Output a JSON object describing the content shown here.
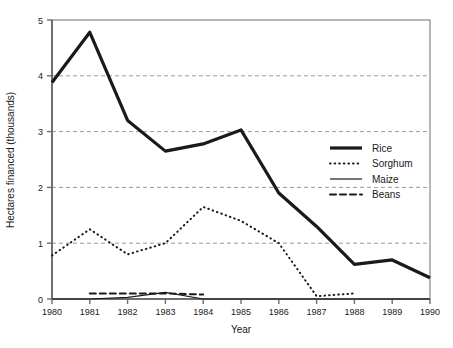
{
  "chart_data": {
    "type": "line",
    "title": "",
    "xlabel": "Year",
    "ylabel": "Hectares financed (thousands)",
    "xlim": [
      1980,
      1990
    ],
    "ylim": [
      0,
      5
    ],
    "xticks": [
      "1980",
      "1981",
      "1982",
      "1983",
      "1984",
      "1985",
      "1986",
      "1987",
      "1988",
      "1989",
      "1990"
    ],
    "yticks": [
      "0",
      "1",
      "2",
      "3",
      "4",
      "5"
    ],
    "grid": "horizontal dashed gridlines at y = 1, 2, 3, 4",
    "legend_position": "upper-right inside plot area",
    "x": [
      1980,
      1981,
      1982,
      1983,
      1984,
      1985,
      1986,
      1987,
      1988,
      1989,
      1990
    ],
    "series": [
      {
        "name": "Rice",
        "style": "solid-thick",
        "color": "#1a1a1a",
        "values": [
          3.88,
          4.78,
          3.2,
          2.65,
          2.78,
          3.03,
          1.9,
          1.3,
          0.62,
          0.7,
          0.38
        ]
      },
      {
        "name": "Sorghum",
        "style": "dotted",
        "color": "#1a1a1a",
        "values": [
          0.78,
          1.25,
          0.8,
          1.0,
          1.65,
          1.4,
          1.0,
          0.05,
          0.1,
          null,
          null
        ]
      },
      {
        "name": "Maize",
        "style": "solid-thin",
        "color": "#1a1a1a",
        "values": [
          0.0,
          0.0,
          0.03,
          0.12,
          0.0,
          0.0,
          0.0,
          0.0,
          0.0,
          0.0,
          0.0
        ]
      },
      {
        "name": "Beans",
        "style": "dashed",
        "color": "#1a1a1a",
        "values": [
          null,
          0.1,
          0.1,
          0.1,
          0.08,
          null,
          null,
          null,
          null,
          null,
          null
        ]
      }
    ]
  },
  "axes": {
    "y_title": "Hectares financed (thousands)",
    "x_title": "Year",
    "y_tick_labels": [
      "5",
      "4",
      "3",
      "2",
      "1",
      "0"
    ],
    "x_tick_labels": [
      "1980",
      "1981",
      "1982",
      "1983",
      "1984",
      "1985",
      "1986",
      "1987",
      "1988",
      "1989",
      "1990"
    ]
  },
  "legend": {
    "entries": [
      {
        "label": "Rice",
        "swatch": "solid-thick-line-icon"
      },
      {
        "label": "Sorghum",
        "swatch": "dotted-line-icon"
      },
      {
        "label": "Maize",
        "swatch": "solid-thin-line-icon"
      },
      {
        "label": "Beans",
        "swatch": "dashed-line-icon"
      }
    ]
  },
  "colors": {
    "ink": "#1a1a1a",
    "axis": "#6e6e6e",
    "grid": "#9a9a9a",
    "background": "#ffffff"
  }
}
